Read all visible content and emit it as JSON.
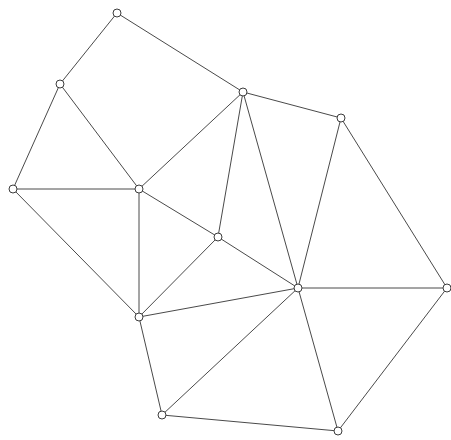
{
  "figure": {
    "width": 451,
    "height": 440,
    "background_color": "#ffffff",
    "edge_color": "#4a4a4a",
    "edge_width": 1,
    "vertex_fill_color": "#ffffff",
    "vertex_stroke_color": "#3c3c3c",
    "vertex_radius": 4
  },
  "chart_data": {
    "type": "scatter",
    "title": "",
    "xlabel": "",
    "ylabel": "",
    "grid": false,
    "legend": null,
    "xlim": [
      0,
      451
    ],
    "ylim": [
      0,
      440
    ],
    "node_count": 12,
    "edge_count": 25,
    "nodes": [
      {
        "id": "n0",
        "label": "",
        "x": 117,
        "y": 13,
        "degree": 2
      },
      {
        "id": "n1",
        "label": "",
        "x": 60,
        "y": 84,
        "degree": 3
      },
      {
        "id": "n2",
        "label": "",
        "x": 243,
        "y": 92,
        "degree": 5
      },
      {
        "id": "n3",
        "label": "",
        "x": 341,
        "y": 118,
        "degree": 4
      },
      {
        "id": "n4",
        "label": "",
        "x": 13,
        "y": 189,
        "degree": 3
      },
      {
        "id": "n5",
        "label": "",
        "x": 139,
        "y": 189,
        "degree": 5
      },
      {
        "id": "n6",
        "label": "",
        "x": 218,
        "y": 237,
        "degree": 4
      },
      {
        "id": "n7",
        "label": "",
        "x": 298,
        "y": 288,
        "degree": 8
      },
      {
        "id": "n8",
        "label": "",
        "x": 447,
        "y": 288,
        "degree": 3
      },
      {
        "id": "n9",
        "label": "",
        "x": 139,
        "y": 317,
        "degree": 5
      },
      {
        "id": "n10",
        "label": "",
        "x": 162,
        "y": 415,
        "degree": 3
      },
      {
        "id": "n11",
        "label": "",
        "x": 338,
        "y": 431,
        "degree": 3
      }
    ],
    "edges": [
      {
        "from": "n0",
        "to": "n1"
      },
      {
        "from": "n0",
        "to": "n2"
      },
      {
        "from": "n1",
        "to": "n4"
      },
      {
        "from": "n1",
        "to": "n5"
      },
      {
        "from": "n2",
        "to": "n3"
      },
      {
        "from": "n2",
        "to": "n5"
      },
      {
        "from": "n2",
        "to": "n6"
      },
      {
        "from": "n2",
        "to": "n7"
      },
      {
        "from": "n3",
        "to": "n7"
      },
      {
        "from": "n3",
        "to": "n8"
      },
      {
        "from": "n4",
        "to": "n5"
      },
      {
        "from": "n4",
        "to": "n9"
      },
      {
        "from": "n5",
        "to": "n6"
      },
      {
        "from": "n5",
        "to": "n9"
      },
      {
        "from": "n6",
        "to": "n7"
      },
      {
        "from": "n6",
        "to": "n9"
      },
      {
        "from": "n7",
        "to": "n8"
      },
      {
        "from": "n7",
        "to": "n9"
      },
      {
        "from": "n7",
        "to": "n10"
      },
      {
        "from": "n7",
        "to": "n11"
      },
      {
        "from": "n8",
        "to": "n11"
      },
      {
        "from": "n9",
        "to": "n10"
      },
      {
        "from": "n10",
        "to": "n11"
      }
    ]
  }
}
